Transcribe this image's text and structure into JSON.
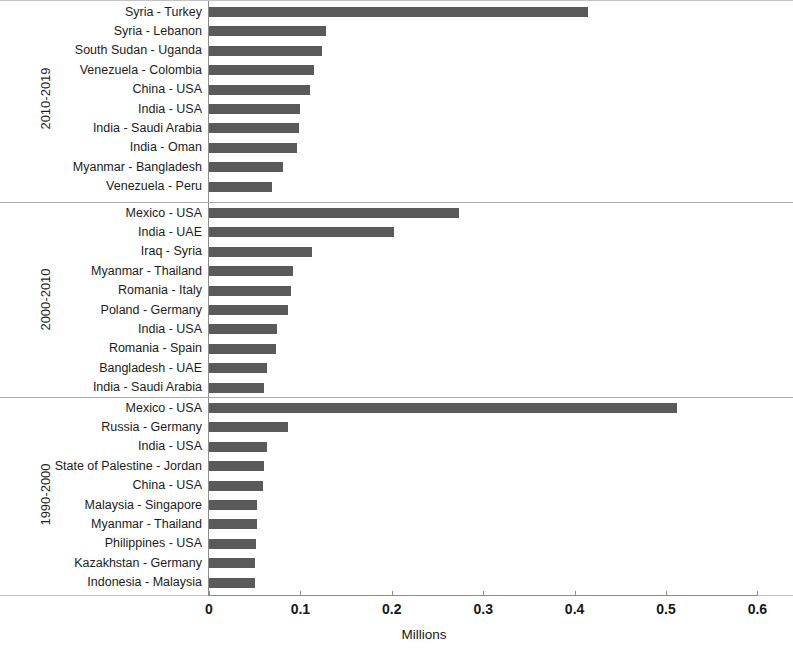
{
  "chart_data": {
    "type": "bar",
    "orientation": "horizontal",
    "title": "",
    "xlabel": "Millions",
    "ylabel": "",
    "xlim": [
      0,
      0.6
    ],
    "xticks": [
      "0",
      "0.1",
      "0.2",
      "0.3",
      "0.4",
      "0.5",
      "0.6"
    ],
    "xtick_values": [
      0,
      0.1,
      0.2,
      0.3,
      0.4,
      0.5,
      0.6
    ],
    "grid": false,
    "legend": false,
    "bar_color": "#5a5a5a",
    "panel_groups": [
      {
        "group_label": "2010-2019",
        "categories": [
          "Syria - Turkey",
          "Syria - Lebanon",
          "South Sudan - Uganda",
          "Venezuela - Colombia",
          "China - USA",
          "India - USA",
          "India - Saudi Arabia",
          "India - Oman",
          "Myanmar - Bangladesh",
          "Venezuela - Peru"
        ],
        "values": [
          0.415,
          0.128,
          0.124,
          0.115,
          0.11,
          0.1,
          0.098,
          0.096,
          0.081,
          0.069
        ]
      },
      {
        "group_label": "2000-2010",
        "categories": [
          "Mexico - USA",
          "India - UAE",
          "Iraq - Syria",
          "Myanmar - Thailand",
          "Romania - Italy",
          "Poland - Germany",
          "India - USA",
          "Romania - Spain",
          "Bangladesh - UAE",
          "India - Saudi Arabia"
        ],
        "values": [
          0.274,
          0.202,
          0.113,
          0.092,
          0.09,
          0.086,
          0.074,
          0.073,
          0.063,
          0.06
        ]
      },
      {
        "group_label": "1990-2000",
        "categories": [
          "Mexico - USA",
          "Russia - Germany",
          "India - USA",
          "State of Palestine - Jordan",
          "China - USA",
          "Malaysia - Singapore",
          "Myanmar - Thailand",
          "Philippines - USA",
          "Kazakhstan - Germany",
          "Indonesia - Malaysia"
        ],
        "values": [
          0.512,
          0.086,
          0.063,
          0.06,
          0.059,
          0.053,
          0.052,
          0.051,
          0.05,
          0.05
        ]
      }
    ]
  }
}
